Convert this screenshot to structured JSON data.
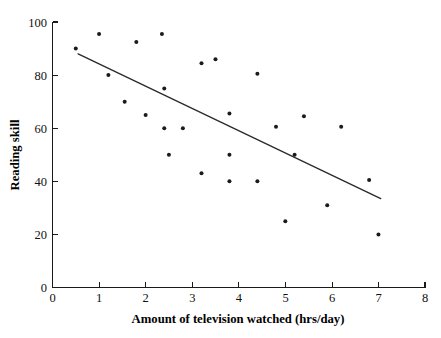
{
  "chart_data": {
    "type": "scatter",
    "title": "",
    "xlabel": "Amount of television watched (hrs/day)",
    "ylabel": "Reading skill",
    "xlim": [
      0,
      8
    ],
    "ylim": [
      0,
      100
    ],
    "xticks": [
      "0",
      "1",
      "2",
      "3",
      "4",
      "5",
      "6",
      "7",
      "8"
    ],
    "xtick_values": [
      0,
      1,
      2,
      3,
      4,
      5,
      6,
      7,
      8
    ],
    "yticks": [
      "0",
      "20",
      "40",
      "60",
      "80",
      "100"
    ],
    "ytick_values": [
      0,
      20,
      40,
      60,
      80,
      100
    ],
    "grid": false,
    "legend": null,
    "point_color": "#1b1b1b",
    "line_color": "#2a2a2a",
    "points": [
      [
        0.5,
        90.0
      ],
      [
        1.0,
        95.5
      ],
      [
        1.2,
        80.0
      ],
      [
        1.55,
        70.0
      ],
      [
        1.8,
        92.5
      ],
      [
        2.0,
        65.0
      ],
      [
        2.35,
        95.5
      ],
      [
        2.4,
        75.0
      ],
      [
        2.4,
        60.0
      ],
      [
        2.5,
        50.0
      ],
      [
        2.8,
        60.0
      ],
      [
        3.2,
        84.5
      ],
      [
        3.2,
        43.0
      ],
      [
        3.5,
        86.0
      ],
      [
        3.8,
        65.5
      ],
      [
        3.8,
        50.0
      ],
      [
        3.8,
        40.0
      ],
      [
        4.4,
        80.5
      ],
      [
        4.4,
        40.0
      ],
      [
        4.8,
        60.5
      ],
      [
        5.0,
        25.0
      ],
      [
        5.2,
        50.0
      ],
      [
        5.4,
        64.5
      ],
      [
        5.9,
        31.0
      ],
      [
        6.2,
        60.5
      ],
      [
        6.8,
        40.5
      ],
      [
        7.0,
        20.0
      ]
    ],
    "trendline": {
      "x": [
        0.55,
        7.05
      ],
      "y": [
        88.0,
        33.5
      ],
      "description": "negative linear trend line"
    }
  }
}
